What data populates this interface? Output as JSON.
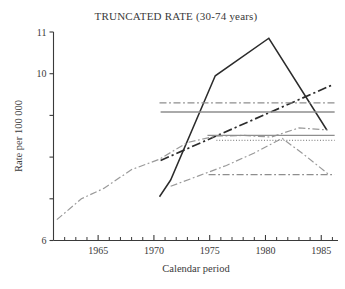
{
  "chart_data": {
    "type": "line",
    "title": "TRUNCATED RATE (30-74 years)",
    "xlabel": "Calendar period",
    "ylabel": "Rate per 100 000",
    "xlim": [
      1961,
      1986.5
    ],
    "ylim": [
      6,
      11
    ],
    "grid": false,
    "legend": "none",
    "xticks": [
      1965,
      1970,
      1975,
      1980,
      1985
    ],
    "xtick_labels": [
      "1965",
      "1970",
      "1975",
      "1980",
      "1985"
    ],
    "xminor_step": 1,
    "yticks": [
      6,
      7,
      8,
      9,
      10,
      11
    ],
    "ytick_labels": [
      "6",
      "",
      "",
      "",
      "10",
      "11"
    ],
    "series": [
      {
        "name": "observed-rate",
        "style": "solid",
        "color": "#2b2b2b",
        "width": 1.5,
        "x": [
          1970.5,
          1971.5,
          1975.5,
          1980.3,
          1985.5
        ],
        "y": [
          7.05,
          7.45,
          9.95,
          10.85,
          8.65
        ]
      },
      {
        "name": "age-cohort-fit",
        "style": "dashdot",
        "color": "#2b2b2b",
        "width": 1.7,
        "x": [
          1970.6,
          1985.9
        ],
        "y": [
          7.92,
          9.72
        ]
      },
      {
        "name": "long-term-trend",
        "style": "dashdot",
        "color": "#9a9a9a",
        "width": 1.2,
        "x": [
          1961.3,
          1963.5,
          1965.5,
          1968.0,
          1970.5,
          1973.0,
          1975.5,
          1978.0,
          1980.5,
          1983.0,
          1985.6
        ],
        "y": [
          6.5,
          7.0,
          7.25,
          7.7,
          7.95,
          8.35,
          8.5,
          8.52,
          8.48,
          8.7,
          8.65
        ]
      },
      {
        "name": "period-effect-curve",
        "style": "dashdot",
        "color": "#9a9a9a",
        "width": 1.2,
        "x": [
          1971.5,
          1974.0,
          1976.5,
          1979.0,
          1981.5,
          1983.5,
          1985.6
        ],
        "y": [
          7.3,
          7.55,
          7.8,
          8.1,
          8.45,
          8.05,
          7.6
        ]
      },
      {
        "name": "upper-reference-level",
        "style": "dashdot",
        "color": "#8e8e8e",
        "width": 1.4,
        "x": [
          1970.5,
          1986.2
        ],
        "y": [
          9.3,
          9.3
        ]
      },
      {
        "name": "mean-reference-level",
        "style": "solid",
        "color": "#8e8e8e",
        "width": 1.4,
        "x": [
          1970.6,
          1986.2
        ],
        "y": [
          9.08,
          9.08
        ]
      },
      {
        "name": "fitted-reference-level",
        "style": "solid",
        "color": "#8e8e8e",
        "width": 1.4,
        "x": [
          1974.8,
          1986.2
        ],
        "y": [
          8.52,
          8.52
        ]
      },
      {
        "name": "dotted-reference-level",
        "style": "dotted",
        "color": "#8e8e8e",
        "width": 1.1,
        "x": [
          1975.6,
          1986.2
        ],
        "y": [
          8.4,
          8.4
        ]
      },
      {
        "name": "lower-reference-level",
        "style": "dashdot",
        "color": "#8e8e8e",
        "width": 1.4,
        "x": [
          1974.9,
          1986.2
        ],
        "y": [
          7.58,
          7.58
        ]
      }
    ]
  }
}
